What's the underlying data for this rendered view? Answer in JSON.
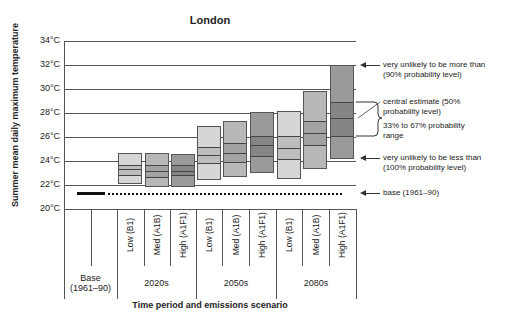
{
  "chart_data": {
    "type": "bar",
    "title": "London",
    "xlabel": "Time period and emissions scenario",
    "ylabel": "Summer mean daily maximum temperature",
    "y_ticks": [
      "34°C",
      "32°C",
      "30°C",
      "28°C",
      "26°C",
      "24°C",
      "22°C",
      "20°C"
    ],
    "ylim": [
      20,
      34
    ],
    "grid": true,
    "base": {
      "label": "Base (1961–90)",
      "value": 21.3
    },
    "groups": [
      {
        "period": "2020s",
        "scenarios": [
          {
            "name": "Low (B1)",
            "p10": 22.1,
            "p33": 22.8,
            "p50": 23.3,
            "p67": 23.7,
            "p90": 24.7
          },
          {
            "name": "Med (A1B)",
            "p10": 21.8,
            "p33": 22.7,
            "p50": 23.2,
            "p67": 23.7,
            "p90": 24.7
          },
          {
            "name": "High (A1F1)",
            "p10": 21.8,
            "p33": 22.8,
            "p50": 23.2,
            "p67": 23.7,
            "p90": 24.6
          }
        ]
      },
      {
        "period": "2050s",
        "scenarios": [
          {
            "name": "Low (B1)",
            "p10": 22.4,
            "p33": 23.8,
            "p50": 24.5,
            "p67": 25.2,
            "p90": 26.9
          },
          {
            "name": "Med (A1B)",
            "p10": 22.7,
            "p33": 23.9,
            "p50": 24.7,
            "p67": 25.5,
            "p90": 27.3
          },
          {
            "name": "High (A1F1)",
            "p10": 23.0,
            "p33": 24.4,
            "p50": 25.3,
            "p67": 26.1,
            "p90": 28.1
          }
        ]
      },
      {
        "period": "2080s",
        "scenarios": [
          {
            "name": "Low (B1)",
            "p10": 22.5,
            "p33": 24.2,
            "p50": 25.1,
            "p67": 26.1,
            "p90": 28.2
          },
          {
            "name": "Med (A1B)",
            "p10": 23.3,
            "p33": 25.3,
            "p50": 26.3,
            "p67": 27.3,
            "p90": 29.8
          },
          {
            "name": "High (A1F1)",
            "p10": 24.2,
            "p33": 26.1,
            "p50": 27.6,
            "p67": 28.9,
            "p90": 32.0
          }
        ]
      }
    ],
    "annotations": [
      "very unlikely to be more than (90% probability level)",
      "central estimate (50% probability level)",
      "33% to 67% probability range",
      "very unlikely to be less than (100% probability level)",
      "base (1961–90)"
    ]
  },
  "labels": {
    "title": "London",
    "ylabel": "Summer mean daily maximum temperature",
    "xlabel": "Time period and emissions scenario",
    "ticks": [
      "34°C",
      "32°C",
      "30°C",
      "28°C",
      "26°C",
      "24°C",
      "22°C",
      "20°C"
    ],
    "scenarios": [
      "Low (B1)",
      "Med (A1B)",
      "High (A1F1)",
      "Low (B1)",
      "Med (A1B)",
      "High (A1F1)",
      "Low (B1)",
      "Med (A1B)",
      "High (A1F1)"
    ],
    "base_line1": "Base",
    "base_line2": "(1961–90)",
    "periods": [
      "2020s",
      "2050s",
      "2080s"
    ],
    "ann_top1": "very unlikely to be more than",
    "ann_top2": "(90% probability level)",
    "ann_mid1": "central estimate (50%",
    "ann_mid2": "probability level)",
    "ann_range1": "33% to 67% probability",
    "ann_range2": "range",
    "ann_bot1": "very unlikely to be less than",
    "ann_bot2": "(100% probability level)",
    "ann_base": "base (1961–90)"
  },
  "colors": {
    "low_outer": "#d6d6d6",
    "low_inner": "#bdbdbd",
    "med_outer": "#b8b8b8",
    "med_inner": "#a2a2a2",
    "high_outer": "#9a9a9a",
    "high_inner": "#858585"
  }
}
